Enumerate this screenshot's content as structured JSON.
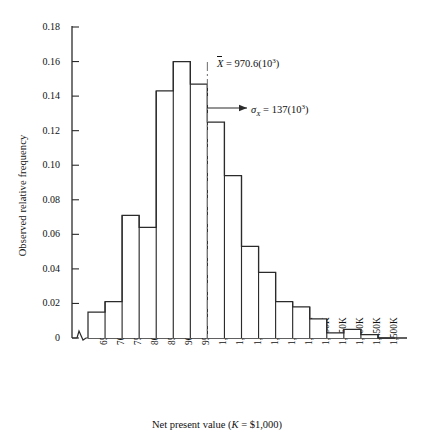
{
  "chart_data": {
    "type": "bar",
    "title": "",
    "xlabel": "Net present value (K = $1,000)",
    "ylabel": "Observed relative frequency",
    "categories": [
      "650K",
      "700K",
      "750K",
      "800K",
      "850K",
      "900K",
      "950K",
      "1,000K",
      "1,050K",
      "1,100K",
      "1,150K",
      "1,200K",
      "1,250K",
      "1,300K",
      "1,350K",
      "1,400K",
      "1,450K",
      "1,500K"
    ],
    "values": [
      0.015,
      0.021,
      0.071,
      0.064,
      0.143,
      0.16,
      0.147,
      0.125,
      0.094,
      0.053,
      0.038,
      0.021,
      0.018,
      0.011,
      0.003,
      0.005,
      0.002,
      0.0
    ],
    "ylim": [
      0,
      0.18
    ],
    "ytick_labels": [
      "0",
      "0.02",
      "0.04",
      "0.06",
      "0.08",
      "0.10",
      "0.12",
      "0.14",
      "0.16",
      "0.18"
    ],
    "ytick_values": [
      0,
      0.02,
      0.04,
      0.06,
      0.08,
      0.1,
      0.12,
      0.14,
      0.16,
      0.18
    ],
    "grid": false,
    "legend": "none",
    "axis_break": true,
    "annotations": [
      {
        "name": "mean-line",
        "kind": "vertical-dash-dot-line",
        "at_category_edge": 7,
        "label_plain": "X̄ = 970.6(10³)",
        "symbol": "X",
        "overbar": true,
        "equals": "=",
        "value": "970.6",
        "power_base": "(10",
        "power_exp": "3",
        "power_close": ")"
      },
      {
        "name": "sigma-arrow",
        "kind": "horizontal-arrow",
        "label_plain": "σX = 137(10³)",
        "symbol": "σ",
        "subscript": "X",
        "equals": "=",
        "value": "137",
        "power_base": "(10",
        "power_exp": "3",
        "power_close": ")"
      }
    ],
    "xtitle_parts": {
      "lead": "Net present value (",
      "italic_k": "K",
      "tail": " = $1,000)"
    },
    "colors": {
      "bar_stroke": "#2b2b2b",
      "bar_fill": "#ffffff",
      "axis": "#2b2b2b",
      "mean_line": "#7a7a7a",
      "text": "#111111"
    }
  }
}
